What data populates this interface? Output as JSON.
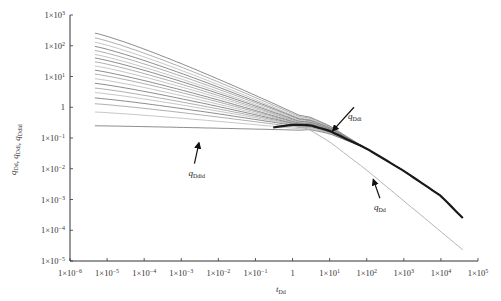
{
  "chart_data": {
    "type": "line",
    "title": "",
    "xlabel": "t_Dd",
    "ylabel": "q_Dd, q_Ddi, q_Ddid",
    "xscale": "log",
    "yscale": "log",
    "xlim": [
      1e-06,
      100000.0
    ],
    "ylim": [
      1e-05,
      1000.0
    ],
    "grid": false,
    "legend": "none",
    "x_ticks": [
      {
        "value": 1e-06,
        "base": "1×10",
        "exp": "−6"
      },
      {
        "value": 1e-05,
        "base": "1×10",
        "exp": "−5"
      },
      {
        "value": 0.0001,
        "base": "1×10",
        "exp": "−4"
      },
      {
        "value": 0.001,
        "base": "1×10",
        "exp": "−3"
      },
      {
        "value": 0.01,
        "base": "1×10",
        "exp": "−2"
      },
      {
        "value": 0.1,
        "base": "1×10",
        "exp": "−1"
      },
      {
        "value": 1,
        "base": "1",
        "exp": ""
      },
      {
        "value": 10.0,
        "base": "1×10",
        "exp": "1"
      },
      {
        "value": 100.0,
        "base": "1×10",
        "exp": "2"
      },
      {
        "value": 1000.0,
        "base": "1×10",
        "exp": "3"
      },
      {
        "value": 10000.0,
        "base": "1×10",
        "exp": "4"
      },
      {
        "value": 100000.0,
        "base": "1×10",
        "exp": "5"
      }
    ],
    "y_ticks": [
      {
        "value": 1000.0,
        "base": "1×10",
        "exp": "3"
      },
      {
        "value": 100.0,
        "base": "1×10",
        "exp": "2"
      },
      {
        "value": 10.0,
        "base": "1×10",
        "exp": "1"
      },
      {
        "value": 1,
        "base": "1",
        "exp": ""
      },
      {
        "value": 0.1,
        "base": "1×10",
        "exp": "−1"
      },
      {
        "value": 0.01,
        "base": "1×10",
        "exp": "−2"
      },
      {
        "value": 0.001,
        "base": "1×10",
        "exp": "−3"
      },
      {
        "value": 0.0001,
        "base": "1×10",
        "exp": "−4"
      },
      {
        "value": 1e-05,
        "base": "1×10",
        "exp": "−5"
      }
    ],
    "annotations": [
      {
        "text": "q",
        "sub": "Ddi",
        "label_at": [
          40,
          0.55
        ],
        "arrow_to": [
          12,
          0.17
        ]
      },
      {
        "text": "q",
        "sub": "Ddid",
        "label_at": [
          0.002,
          0.008
        ],
        "arrow_to": [
          0.003,
          0.07
        ]
      },
      {
        "text": "q",
        "sub": "Dd",
        "label_at": [
          200,
          0.0006
        ],
        "arrow_to": [
          150,
          0.0045
        ]
      }
    ],
    "series_groups": {
      "ddid_family": {
        "name": "q_Ddid (integral-derivative type curves)",
        "color": "#8a8a8a",
        "x": [
          4.7e-06,
          1e-05,
          0.0001,
          0.001,
          0.01,
          0.1,
          0.5,
          1,
          3,
          10
        ],
        "start_values": [
          257,
          180,
          130,
          95,
          70,
          52,
          40,
          30,
          22,
          16,
          12,
          8.5,
          6,
          4.2,
          3,
          2,
          1.3,
          0.7,
          0.25
        ],
        "converge_to": [
          0.55,
          0.5,
          0.45,
          0.42,
          0.4,
          0.37,
          0.35,
          0.33,
          0.32,
          0.3,
          0.29,
          0.28,
          0.27,
          0.26,
          0.25,
          0.24,
          0.22,
          0.2,
          0.18
        ]
      },
      "ddi_curve": {
        "name": "q_Ddi",
        "color": "#1a1a1a",
        "x": [
          0.3,
          1,
          3,
          10,
          100,
          1000,
          10000,
          39000
        ],
        "values": [
          0.22,
          0.27,
          0.26,
          0.17,
          0.045,
          0.0085,
          0.0013,
          0.00025
        ]
      },
      "dd_curve": {
        "name": "q_Dd",
        "color": "#b5b5b5",
        "x": [
          1,
          3,
          10,
          100,
          1000,
          10000,
          39000
        ],
        "values": [
          0.3,
          0.18,
          0.075,
          0.009,
          0.0009,
          9e-05,
          2.3e-05
        ]
      }
    }
  }
}
